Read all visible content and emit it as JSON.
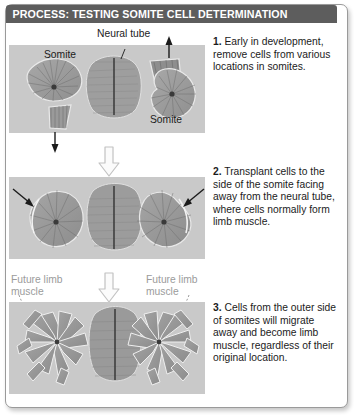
{
  "figure": {
    "title": "PROCESS: TESTING SOMITE CELL DETERMINATION",
    "title_bar_color": "#5d5d5d",
    "plate_background": "#c9c9c9",
    "frame_border_color": "#9a9a9a"
  },
  "steps": [
    {
      "number": "1.",
      "text": "Early in development, remove cells from various locations in somites."
    },
    {
      "number": "2.",
      "text": "Transplant cells to the side of the somite facing away from the neural tube, where cells normally form limb muscle."
    },
    {
      "number": "3.",
      "text": "Cells from the outer side of somites will migrate away and become limb muscle, regardless of their original location."
    }
  ],
  "labels": {
    "neural_tube": "Neural tube",
    "somite_left": "Somite",
    "somite_right": "Somite",
    "future_limb_muscle_left": "Future limb muscle",
    "future_limb_muscle_right": "Future limb muscle"
  },
  "flow_arrows": [
    {
      "name": "arrow-step1-to-step2",
      "direction": "down"
    },
    {
      "name": "arrow-step2-to-step3",
      "direction": "down"
    }
  ]
}
